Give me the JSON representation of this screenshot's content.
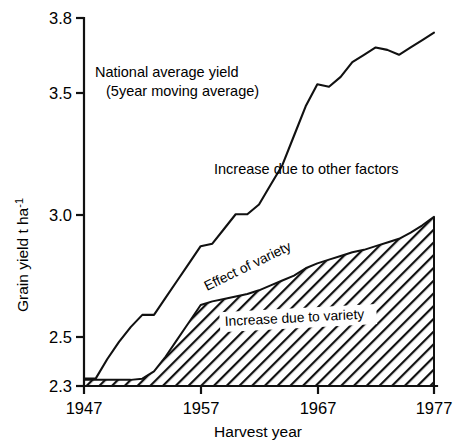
{
  "figure": {
    "background_color": "#ffffff",
    "ink_color": "#111111"
  },
  "annotations": {
    "national_avg_line1": "National average yield",
    "national_avg_line2": "(5year moving average)",
    "other_factors": "Increase due to other factors",
    "effect_of_variety": "Effect of variety",
    "increase_due_to_variety": "Increase due to variety"
  },
  "axes": {
    "y_title_main": "Grain yield   t ha",
    "y_title_exponent": "-1",
    "x_title": "Harvest year",
    "y_ticks": [
      "2.3",
      "2.5",
      "3.0",
      "3.5",
      "3.8"
    ],
    "x_ticks": [
      "1947",
      "1957",
      "1967",
      "1977"
    ]
  },
  "chart_data": {
    "type": "area",
    "title": "",
    "xlabel": "Harvest year",
    "ylabel": "Grain yield  t ha^-1",
    "xlim": [
      1947,
      1977
    ],
    "ylim": [
      2.3,
      3.8
    ],
    "grid": false,
    "legend_position": "inline-annotations",
    "x": [
      1947,
      1948,
      1949,
      1950,
      1951,
      1952,
      1953,
      1954,
      1955,
      1956,
      1957,
      1958,
      1959,
      1960,
      1961,
      1962,
      1963,
      1964,
      1965,
      1966,
      1967,
      1968,
      1969,
      1970,
      1971,
      1972,
      1973,
      1974,
      1975,
      1976,
      1977
    ],
    "series": [
      {
        "name": "National average yield (5year moving average)",
        "style": "line",
        "values": [
          2.33,
          2.33,
          2.41,
          2.48,
          2.54,
          2.59,
          2.59,
          2.66,
          2.73,
          2.8,
          2.87,
          2.88,
          2.94,
          3.0,
          3.0,
          3.04,
          3.12,
          3.2,
          3.32,
          3.44,
          3.53,
          3.52,
          3.56,
          3.62,
          3.65,
          3.68,
          3.67,
          3.65,
          3.68,
          3.71,
          3.74
        ]
      },
      {
        "name": "Effect of variety (top of hatched band)",
        "style": "area-hatched",
        "values": [
          2.325,
          2.325,
          2.325,
          2.325,
          2.325,
          2.33,
          2.36,
          2.42,
          2.49,
          2.56,
          2.63,
          2.645,
          2.655,
          2.665,
          2.675,
          2.69,
          2.71,
          2.73,
          2.75,
          2.78,
          2.8,
          2.815,
          2.83,
          2.845,
          2.855,
          2.87,
          2.885,
          2.9,
          2.925,
          2.955,
          2.99
        ]
      },
      {
        "name": "Baseline",
        "style": "baseline",
        "values": [
          2.3,
          2.3,
          2.3,
          2.3,
          2.3,
          2.3,
          2.3,
          2.3,
          2.3,
          2.3,
          2.3,
          2.3,
          2.3,
          2.3,
          2.3,
          2.3,
          2.3,
          2.3,
          2.3,
          2.3,
          2.3,
          2.3,
          2.3,
          2.3,
          2.3,
          2.3,
          2.3,
          2.3,
          2.3,
          2.3,
          2.3
        ]
      }
    ],
    "regions": [
      {
        "name": "Increase due to variety",
        "fill": "diagonal-hatch",
        "between": [
          "Baseline",
          "Effect of variety (top of hatched band)"
        ]
      },
      {
        "name": "Increase due to other factors",
        "fill": "none",
        "between": [
          "Effect of variety (top of hatched band)",
          "National average yield (5year moving average)"
        ]
      }
    ]
  }
}
